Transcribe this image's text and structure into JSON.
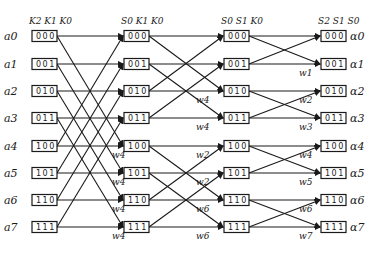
{
  "diagram": {
    "type": "fft-butterfly-signal-flow",
    "column_headers": [
      "K2 K1 K0",
      "S0 K1 K0",
      "S0 S1 K0",
      "S2 S1 S0"
    ],
    "inputs": [
      "a0",
      "a1",
      "a2",
      "a3",
      "a4",
      "a5",
      "a6",
      "a7"
    ],
    "outputs": [
      "α0",
      "α1",
      "α2",
      "α3",
      "α4",
      "α5",
      "α6",
      "α7"
    ],
    "columns": [
      [
        "000",
        "001",
        "010",
        "011",
        "100",
        "101",
        "110",
        "111"
      ],
      [
        "000",
        "001",
        "010",
        "011",
        "100",
        "101",
        "110",
        "111"
      ],
      [
        "000",
        "001",
        "010",
        "011",
        "100",
        "101",
        "110",
        "111"
      ],
      [
        "000",
        "001",
        "010",
        "011",
        "100",
        "101",
        "110",
        "111"
      ]
    ],
    "twiddles": {
      "stage1": [
        "w4",
        "w4",
        "w4",
        "w4"
      ],
      "stage2": [
        "w4",
        "w4",
        "w2",
        "w2",
        "w6",
        "w6"
      ],
      "stage3": [
        "w1",
        "w2",
        "w3",
        "w4",
        "w5",
        "w6",
        "w7"
      ]
    }
  }
}
